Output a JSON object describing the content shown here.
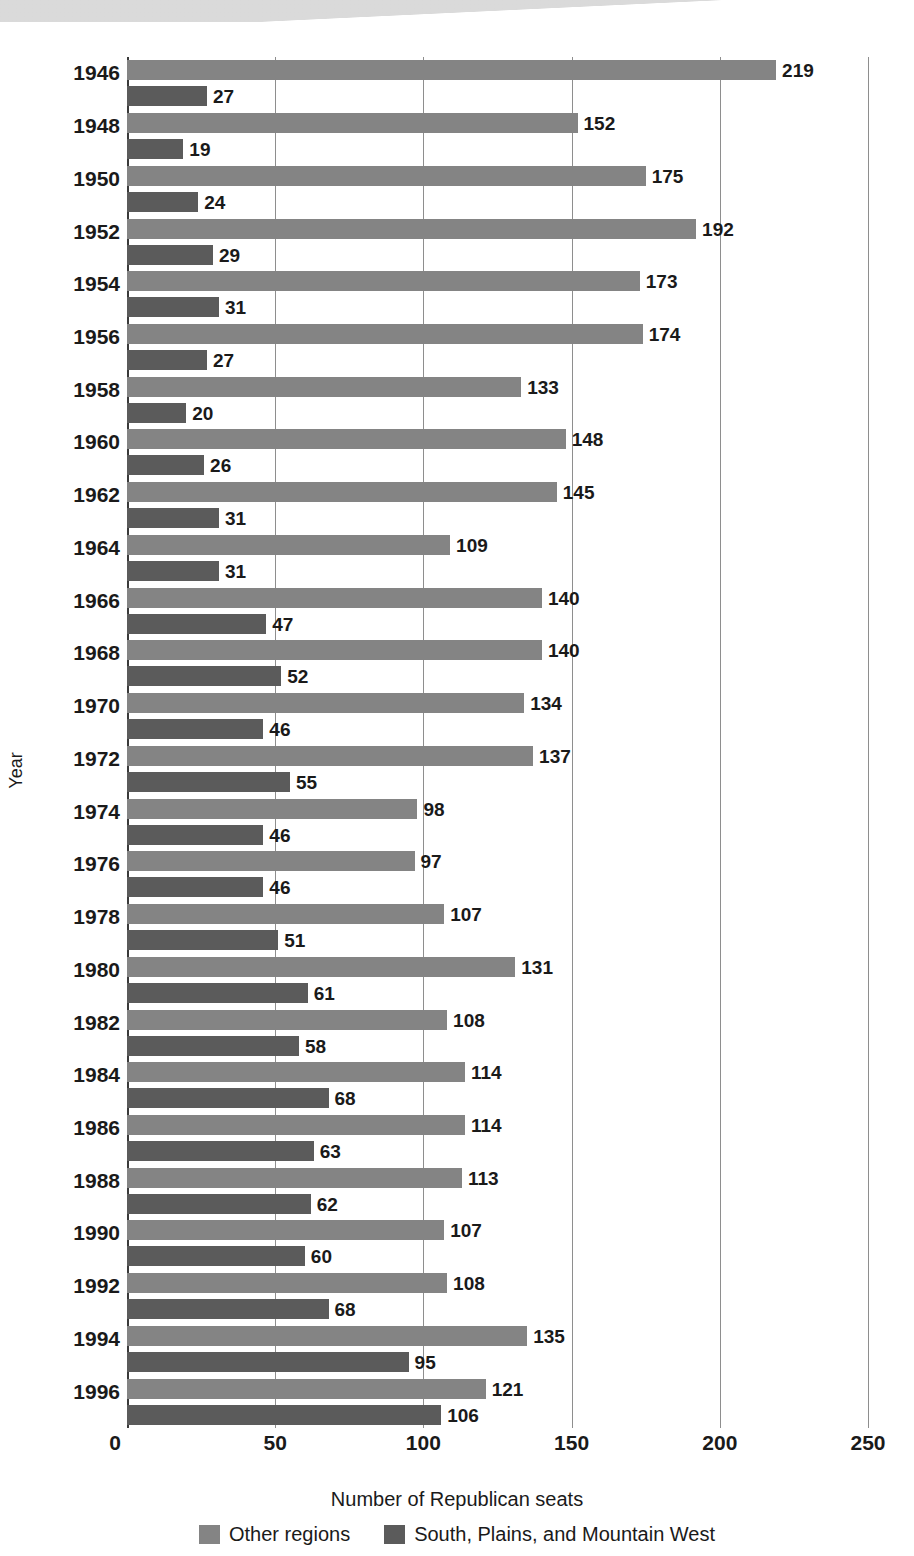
{
  "chart_data": {
    "type": "bar",
    "orientation": "horizontal",
    "title": "",
    "xlabel": "Number of Republican seats",
    "ylabel": "Year",
    "xlim": [
      0,
      250
    ],
    "xticks": [
      0,
      50,
      100,
      150,
      200,
      250
    ],
    "grid": true,
    "legend_position": "bottom",
    "categories": [
      "1946",
      "1948",
      "1950",
      "1952",
      "1954",
      "1956",
      "1958",
      "1960",
      "1962",
      "1964",
      "1966",
      "1968",
      "1970",
      "1972",
      "1974",
      "1976",
      "1978",
      "1980",
      "1982",
      "1984",
      "1986",
      "1988",
      "1990",
      "1992",
      "1994",
      "1996"
    ],
    "series": [
      {
        "name": "Other regions",
        "color": "#848484",
        "values": [
          219,
          152,
          175,
          192,
          173,
          174,
          133,
          148,
          145,
          109,
          140,
          140,
          134,
          137,
          98,
          97,
          107,
          131,
          108,
          114,
          114,
          113,
          107,
          108,
          135,
          121
        ]
      },
      {
        "name": "South, Plains, and Mountain West",
        "color": "#5b5b5b",
        "values": [
          27,
          19,
          24,
          29,
          31,
          27,
          20,
          26,
          31,
          31,
          47,
          52,
          46,
          55,
          46,
          46,
          51,
          61,
          58,
          68,
          63,
          62,
          60,
          68,
          95,
          106
        ]
      }
    ]
  }
}
